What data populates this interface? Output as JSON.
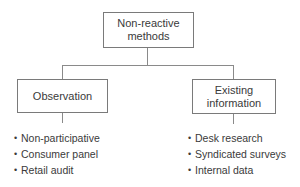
{
  "diagram": {
    "root": {
      "label": "Non-reactive\nmethods"
    },
    "branches": [
      {
        "label": "Observation",
        "items": [
          "Non-participative",
          "Consumer panel",
          "Retail audit"
        ]
      },
      {
        "label": "Existing\ninformation",
        "items": [
          "Desk research",
          "Syndicated surveys",
          "Internal data"
        ]
      }
    ],
    "bullet_glyph": "•",
    "colors": {
      "line": "#8a8a8a",
      "box_border": "#7a7a7a",
      "text": "#3a3a3a"
    }
  }
}
